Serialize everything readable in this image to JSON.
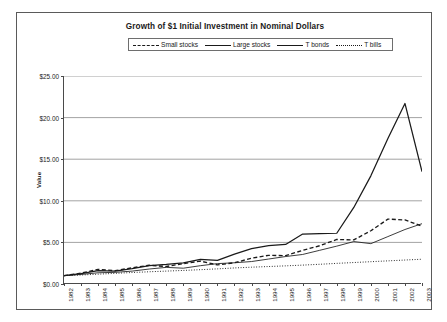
{
  "chart_data": {
    "type": "line",
    "title": "Growth of $1 Initial Investment in Nominal Dollars",
    "xlabel": "",
    "ylabel": "Value",
    "ylim": [
      0,
      25
    ],
    "ytick_step": 5,
    "ytick_labels": [
      "$0.00",
      "$5.00",
      "$10.00",
      "$15.00",
      "$20.00",
      "$25.00"
    ],
    "grid": "horizontal",
    "legend_position": "top-center",
    "x": [
      1982,
      1983,
      1984,
      1985,
      1986,
      1987,
      1988,
      1989,
      1990,
      1991,
      1992,
      1993,
      1994,
      1995,
      1996,
      1997,
      1998,
      1999,
      2000,
      2001,
      2002,
      2003
    ],
    "categories": [
      "1982",
      "1983",
      "1984",
      "1985",
      "1986",
      "1987",
      "1988",
      "1989",
      "1990",
      "1991",
      "1992",
      "1993",
      "1994",
      "1995",
      "1996",
      "1997",
      "1998",
      "1999",
      "2000",
      "2001",
      "2002",
      "2003"
    ],
    "series": [
      {
        "name": "Small stocks",
        "style": "dashed",
        "values": [
          1.0,
          1.3,
          1.75,
          1.6,
          1.95,
          2.25,
          2.1,
          2.45,
          2.75,
          2.3,
          2.55,
          3.1,
          3.45,
          3.4,
          4.05,
          4.6,
          5.35,
          5.3,
          6.4,
          7.8,
          7.7,
          6.95
        ]
      },
      {
        "name": "Large stocks",
        "style": "solid-thick",
        "values": [
          1.0,
          1.25,
          1.6,
          1.55,
          1.85,
          2.2,
          2.35,
          2.55,
          2.95,
          2.85,
          3.6,
          4.25,
          4.6,
          4.75,
          6.0,
          6.05,
          6.1,
          9.2,
          13.0,
          17.5,
          21.7,
          13.5
        ]
      },
      {
        "name": "T bonds",
        "style": "solid-thin",
        "values": [
          1.0,
          1.15,
          1.35,
          1.4,
          1.55,
          1.8,
          2.0,
          1.9,
          2.2,
          2.45,
          2.55,
          2.7,
          3.0,
          3.3,
          3.55,
          4.05,
          4.55,
          5.1,
          4.85,
          5.7,
          6.55,
          7.25
        ]
      },
      {
        "name": "T bills",
        "style": "dotted",
        "values": [
          1.0,
          1.08,
          1.18,
          1.28,
          1.38,
          1.47,
          1.55,
          1.63,
          1.72,
          1.82,
          1.93,
          2.02,
          2.1,
          2.18,
          2.27,
          2.37,
          2.48,
          2.58,
          2.68,
          2.78,
          2.88,
          2.98
        ]
      }
    ],
    "annotations": {
      "peak_large_stocks_value": 21.7,
      "end_values": {
        "Large stocks": 13.5,
        "T bonds": 8.5,
        "Small stocks": 6.95,
        "T bills": 2.98
      }
    }
  }
}
